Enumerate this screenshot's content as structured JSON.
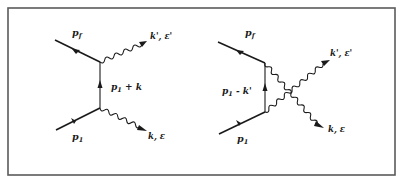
{
  "figure": {
    "diagrams": [
      {
        "id": "direct",
        "labels": {
          "incoming_electron": "p",
          "incoming_electron_sub": "1",
          "outgoing_electron": "p",
          "outgoing_electron_sub": "f",
          "internal": "p",
          "internal_sub": "1",
          "internal_rest": " + k",
          "photon_out_top": "k', ε'",
          "photon_bottom": "k, ε"
        }
      },
      {
        "id": "crossed",
        "labels": {
          "incoming_electron": "p",
          "incoming_electron_sub": "1",
          "outgoing_electron": "p",
          "outgoing_electron_sub": "f",
          "internal": "p",
          "internal_sub": "1",
          "internal_rest": " - k'",
          "photon_out_top": "k', ε'",
          "photon_bottom": "k, ε"
        }
      }
    ]
  }
}
